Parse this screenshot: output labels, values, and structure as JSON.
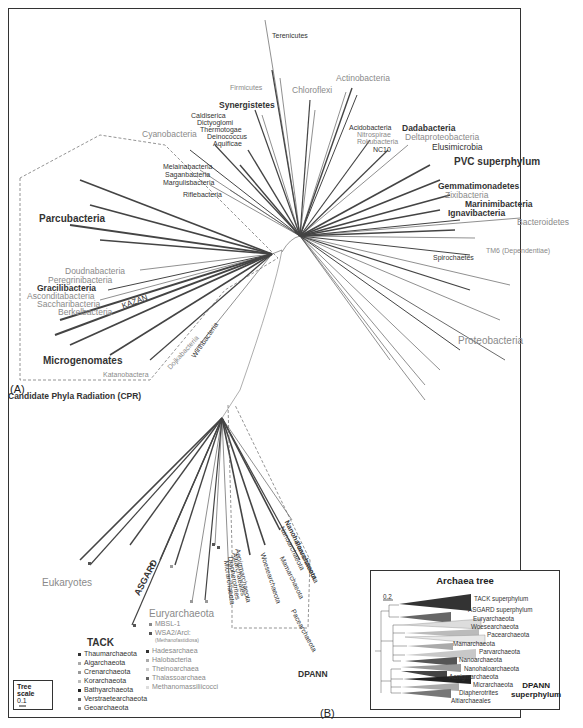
{
  "panels": {
    "a": "(A)",
    "b": "(B)"
  },
  "bacteria": {
    "top": [
      {
        "label": "Terenicutes",
        "style": "dark"
      },
      {
        "label": "Firmicutes",
        "style": "gray"
      },
      {
        "label": "Actinobacteria",
        "style": "gray"
      },
      {
        "label": "Chloroflexi",
        "style": "gray"
      },
      {
        "label": "Synergistetes",
        "style": "bold"
      },
      {
        "label": "Caldiserica",
        "style": "dark"
      },
      {
        "label": "Dictyoglomi",
        "style": "dark"
      },
      {
        "label": "Thermotogae",
        "style": "dark"
      },
      {
        "label": "Deinococcus",
        "style": "dark"
      },
      {
        "label": "Aquificae",
        "style": "dark"
      },
      {
        "label": "Cyanobacteria",
        "style": "gray"
      },
      {
        "label": "Melainabacteria",
        "style": "dark"
      },
      {
        "label": "Saganbacteria",
        "style": "dark"
      },
      {
        "label": "Margulisbacteria",
        "style": "dark"
      },
      {
        "label": "Riflebacteria",
        "style": "dark"
      }
    ],
    "right": [
      {
        "label": "Acidobacteria",
        "style": "dark"
      },
      {
        "label": "Nitrospirae",
        "style": "gray"
      },
      {
        "label": "Rokubacteria",
        "style": "gray"
      },
      {
        "label": "NC10",
        "style": "dark"
      },
      {
        "label": "Dadabacteria",
        "style": "bold"
      },
      {
        "label": "Deltaproteobacteria",
        "style": "gray"
      },
      {
        "label": "Elusimicrobia",
        "style": "dark"
      },
      {
        "label": "PVC superphylum",
        "style": "bold"
      },
      {
        "label": "Gemmatimonadetes",
        "style": "bold"
      },
      {
        "label": "Zixibacteria",
        "style": "gray"
      },
      {
        "label": "Marinimibacteria",
        "style": "bold"
      },
      {
        "label": "Ignavibacteria",
        "style": "bold"
      },
      {
        "label": "Bacteroidetes",
        "style": "gray"
      },
      {
        "label": "TM6 (Dependentiae)",
        "style": "gray"
      },
      {
        "label": "Spirochaetes",
        "style": "dark"
      },
      {
        "label": "Proteobacteria",
        "style": "gray"
      }
    ],
    "cpr": {
      "title": "Candidate Phyla Radiation (CPR)",
      "labels": [
        {
          "label": "Parcubacteria",
          "style": "bold"
        },
        {
          "label": "Doudnabacteria",
          "style": "gray"
        },
        {
          "label": "Peregrinibacteria",
          "style": "gray"
        },
        {
          "label": "Gracilibacteria",
          "style": "bold"
        },
        {
          "label": "Asconditabacteria",
          "style": "gray"
        },
        {
          "label": "Saccharibacteria",
          "style": "gray"
        },
        {
          "label": "Berkelbacteria",
          "style": "gray"
        },
        {
          "label": "KAZAN",
          "style": "dark"
        },
        {
          "label": "Microgenomates",
          "style": "bold"
        },
        {
          "label": "Katanobactera",
          "style": "gray"
        },
        {
          "label": "Dojkabacteria",
          "style": "gray"
        },
        {
          "label": "Wirthbacteria",
          "style": "dark"
        }
      ]
    }
  },
  "archaea": {
    "eukaryotes": "Eukaryotes",
    "asgard": "ASGARD",
    "euryarchaeota": {
      "title": "Euryarchaeota",
      "items": [
        "MBSL-1",
        "WSA2/Arcl:",
        "(Methanofastidiosa)",
        "Hadesarchaea",
        "Halobacteria",
        "Theinoarchaea",
        "Thalassoarchaea",
        "Methanomassiliicocci"
      ]
    },
    "tack": {
      "title": "TACK",
      "items": [
        "Thaumarchaeota",
        "Aigarchaeota",
        "Crenarchaeota",
        "Korarchaeota",
        "Bathyarchaeota",
        "Verstraetearchaeota",
        "Geoarchaeota"
      ]
    },
    "dpann_clade": {
      "title": "DPANN",
      "labels": [
        "Aenigmarchaeota",
        "Altiarchaeales",
        "Diapherotrites",
        "Micrarchaeota",
        "Woesearchaeota",
        "Nanohaloarchaeota",
        "Nanoarchaeota",
        "Parvarchaeota",
        "Mamarchaeota",
        "Pacearchaeota"
      ]
    }
  },
  "tree_scale": {
    "title": "Tree scale",
    "value": "0.1"
  },
  "archaea_tree": {
    "title": "Archaea tree",
    "scale": "0.2",
    "clades": [
      {
        "label": "TACK superphylum",
        "color": "#3a3a3a"
      },
      {
        "label": "ASGARD superphylum",
        "color": "#6a6a6a"
      },
      {
        "label": "Euryarchaeota",
        "color": "#d8d8d8"
      },
      {
        "label": "Woesearchaeota",
        "color": "#bdbdbd"
      },
      {
        "label": "Pacearchaeota",
        "color": "#e6e6e6"
      },
      {
        "label": "Mamarchaeota",
        "color": "#b0b0b0"
      },
      {
        "label": "Parvarchaeota",
        "color": "#c8c8c8"
      },
      {
        "label": "Nanoarchaeota",
        "color": "#5a5a5a"
      },
      {
        "label": "Nanohaloarchaeota",
        "color": "#9a9a9a"
      },
      {
        "label": "Aenigmarchaeota",
        "color": "#4a4a4a"
      },
      {
        "label": "Micrarchaeota",
        "color": "#2a2a2a"
      },
      {
        "label": "Diapherotrites",
        "color": "#a8a8a8"
      },
      {
        "label": "Altiarchaeales",
        "color": "#7a7a7a"
      }
    ],
    "dpann_label_1": "DPANN",
    "dpann_label_2": "superphylum"
  }
}
